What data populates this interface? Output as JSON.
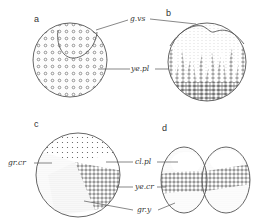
{
  "figure": {
    "panels": [
      {
        "id": "a",
        "letter": "a"
      },
      {
        "id": "b",
        "letter": "b"
      },
      {
        "id": "c",
        "letter": "c"
      },
      {
        "id": "d",
        "letter": "d"
      }
    ],
    "labels": {
      "g_vs": "g.vs",
      "ye_pl": "ye.pl",
      "gr_cr": "gr.cr",
      "cl_pl": "cl.pl",
      "ye_cr": "ye.cr",
      "gr_y": "gr.y"
    },
    "colors": {
      "ink": "#555555",
      "background": "#ffffff"
    }
  }
}
